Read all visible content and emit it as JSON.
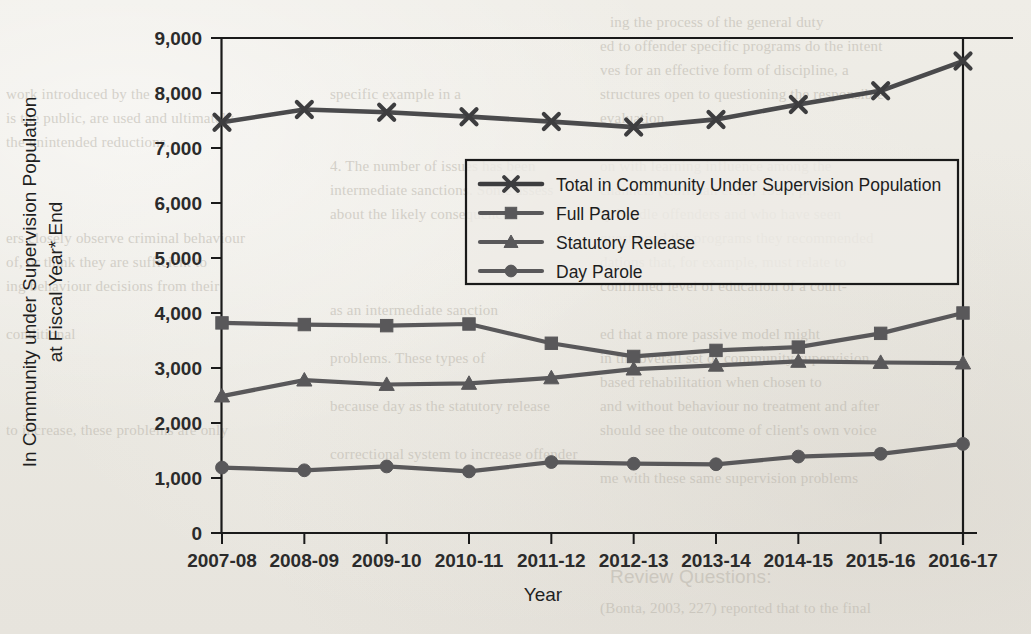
{
  "chart_data": {
    "type": "line",
    "title": "",
    "xlabel": "Year",
    "ylabel": "In Community under Supervision Population at Fiscal Year* End",
    "ylabel_line1": "In Community under Supervision Population",
    "ylabel_line2": "at Fiscal Year* End",
    "categories": [
      "2007-08",
      "2008-09",
      "2009-10",
      "2010-11",
      "2011-12",
      "2012-13",
      "2013-14",
      "2014-15",
      "2015-16",
      "2016-17"
    ],
    "ylim": [
      0,
      9000
    ],
    "ytick_labels": [
      "0",
      "1,000",
      "2,000",
      "3,000",
      "4,000",
      "5,000",
      "6,000",
      "7,000",
      "8,000",
      "9,000"
    ],
    "ytick_values": [
      0,
      1000,
      2000,
      3000,
      4000,
      5000,
      6000,
      7000,
      8000,
      9000
    ],
    "grid": false,
    "legend_position": "center-right",
    "series": [
      {
        "name": "Total in Community Under Supervision Population",
        "marker": "x",
        "color": "#3d3d3f",
        "values": [
          7470,
          7700,
          7650,
          7570,
          7480,
          7380,
          7520,
          7790,
          8040,
          8580
        ]
      },
      {
        "name": "Full Parole",
        "marker": "square",
        "color": "#59585a",
        "values": [
          3820,
          3790,
          3770,
          3800,
          3450,
          3210,
          3320,
          3380,
          3630,
          4000
        ]
      },
      {
        "name": "Statutory Release",
        "marker": "triangle",
        "color": "#59585a",
        "values": [
          2490,
          2780,
          2700,
          2720,
          2820,
          2980,
          3050,
          3120,
          3100,
          3090
        ]
      },
      {
        "name": "Day Parole",
        "marker": "circle",
        "color": "#59585a",
        "values": [
          1190,
          1140,
          1210,
          1120,
          1290,
          1260,
          1250,
          1390,
          1440,
          1620
        ]
      }
    ]
  },
  "legend": {
    "entries": [
      "Total in Community Under Supervision Population",
      "Full Parole",
      "Statutory Release",
      "Day Parole"
    ]
  },
  "ghost_text": {
    "left_column": [
      "work introduced by the",
      "specific example in a",
      "is the public, are used and ultimately",
      "the unintended reductions.",
      "4. The number of issues has been",
      "intermediate sanctions. Some assess",
      "about the likely consequences",
      "ers closely observe criminal behaviour",
      "of, or think they are sufficient to",
      "ing behaviour decisions from their",
      "as an intermediate sanction",
      "conditional",
      "problems. These types of",
      "because day as the statutory release",
      "to increase, these problems are only",
      "correctional system to increase offender"
    ],
    "right_column": [
      "ing the process of the general duty",
      "ed to offender specific programs do the intent",
      "ves for an effective form of discipline, a",
      "structures open to questioning the responsible",
      "evaluation.",
      "on with learning influence among the",
      "channels (Coffman et al., 1994, p.",
      "ry handle offenders and who have seen",
      "questioned the programs they recommended",
      "dations that, for example, must relate to",
      "confirmed level of education of a court-",
      "ed that a more passive model might",
      "in the overall set of community supervision",
      "based rehabilitation when chosen to",
      "and without behaviour no treatment and after",
      "should see the outcome of client's own voice",
      "me with these same supervision problems",
      "(Bonta, 2003, 227) reported that to the final"
    ],
    "bottom_right": "Review Questions:"
  }
}
